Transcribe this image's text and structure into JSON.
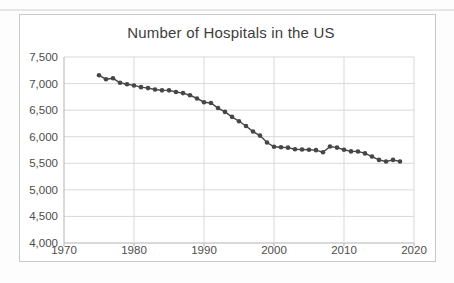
{
  "page": {
    "background_color": "#fdfdfd",
    "scan_artifact_color": "#e6e6e6"
  },
  "chart": {
    "frame_border_color": "#c9c9c9",
    "frame_background": "#ffffff",
    "title_color": "#3d3d3d",
    "label_color": "#4d4d4d",
    "gridline_color": "#d9d9d9",
    "axis_line_color": "#b3b3b3",
    "series_color": "#464646"
  },
  "chart_data": {
    "type": "line",
    "title": "Number of Hospitals in the US",
    "xlabel": "",
    "ylabel": "",
    "legend": false,
    "grid": true,
    "marker": "circle",
    "xlim": [
      1970,
      2020
    ],
    "ylim": [
      4000,
      7500
    ],
    "x": [
      1975,
      1976,
      1977,
      1978,
      1979,
      1980,
      1981,
      1982,
      1983,
      1984,
      1985,
      1986,
      1987,
      1988,
      1989,
      1990,
      1991,
      1992,
      1993,
      1994,
      1995,
      1996,
      1997,
      1998,
      1999,
      2000,
      2001,
      2002,
      2003,
      2004,
      2005,
      2006,
      2007,
      2008,
      2009,
      2010,
      2011,
      2012,
      2013,
      2014,
      2015,
      2016,
      2017,
      2018
    ],
    "values": [
      7156,
      7082,
      7099,
      7015,
      6988,
      6965,
      6933,
      6915,
      6888,
      6872,
      6872,
      6841,
      6821,
      6780,
      6720,
      6649,
      6634,
      6539,
      6467,
      6374,
      6291,
      6201,
      6097,
      6021,
      5890,
      5810,
      5801,
      5794,
      5764,
      5759,
      5756,
      5747,
      5708,
      5815,
      5795,
      5754,
      5724,
      5723,
      5686,
      5627,
      5564,
      5534,
      5564,
      5534
    ],
    "x_ticks": [
      {
        "v": 1970,
        "label": "1970"
      },
      {
        "v": 1980,
        "label": "1980"
      },
      {
        "v": 1990,
        "label": "1990"
      },
      {
        "v": 2000,
        "label": "2000"
      },
      {
        "v": 2010,
        "label": "2010"
      },
      {
        "v": 2020,
        "label": "2020"
      }
    ],
    "y_ticks": [
      {
        "v": 4000,
        "label": "4,000"
      },
      {
        "v": 4500,
        "label": "4,500"
      },
      {
        "v": 5000,
        "label": "5,000"
      },
      {
        "v": 5500,
        "label": "5,500"
      },
      {
        "v": 6000,
        "label": "6,000"
      },
      {
        "v": 6500,
        "label": "6,500"
      },
      {
        "v": 7000,
        "label": "7,000"
      },
      {
        "v": 7500,
        "label": "7,500"
      }
    ]
  }
}
